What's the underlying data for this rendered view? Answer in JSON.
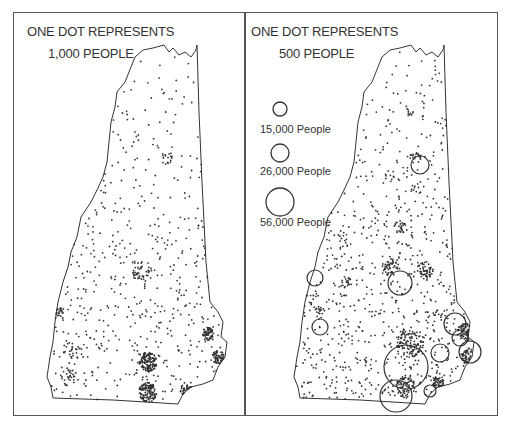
{
  "figure": {
    "left_panel": {
      "title_line1": "ONE DOT REPRESENTS",
      "title_line2": "1,000 PEOPLE",
      "people_per_dot": 1000
    },
    "right_panel": {
      "title_line1": "ONE DOT REPRESENTS",
      "title_line2": "500 PEOPLE",
      "people_per_dot": 500,
      "legend": [
        {
          "label": "15,000 People",
          "value": 15000
        },
        {
          "label": "26,000 People",
          "value": 26000
        },
        {
          "label": "56,000 People",
          "value": 56000
        }
      ]
    },
    "colors": {
      "ink": "#333333",
      "frame": "#555555",
      "background": "#ffffff"
    }
  }
}
